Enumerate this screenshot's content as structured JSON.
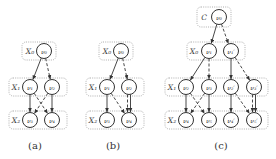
{
  "figure": {
    "panels": [
      {
        "id": "a",
        "caption": "(a)",
        "caption_pos": [
          35,
          145
        ],
        "groups": [
          {
            "label": "X0",
            "display": "X₀",
            "label_pos": [
              30,
              51
            ],
            "box": [
              22,
              42,
              34,
              18
            ]
          },
          {
            "label": "X1",
            "display": "X₁",
            "label_pos": [
              16,
              87
            ],
            "box": [
              9,
              78,
              58,
              18
            ]
          },
          {
            "label": "X2",
            "display": "X₂",
            "label_pos": [
              16,
              120
            ],
            "box": [
              9,
              111,
              58,
              18
            ]
          }
        ],
        "nodes": [
          {
            "id": "v0",
            "display": "ν₀",
            "pos": [
              44,
              51
            ]
          },
          {
            "id": "v1",
            "display": "ν₁",
            "pos": [
              30,
              87
            ]
          },
          {
            "id": "v2",
            "display": "ν₂",
            "pos": [
              52,
              87
            ]
          },
          {
            "id": "v3",
            "display": "ν₃",
            "pos": [
              30,
              120
            ]
          },
          {
            "id": "v4",
            "display": "ν₄",
            "pos": [
              52,
              120
            ]
          }
        ],
        "edges": [
          {
            "from": "v0",
            "to": "v1",
            "style": "solid"
          },
          {
            "from": "v0",
            "to": "v2",
            "style": "dashed"
          },
          {
            "from": "v1",
            "to": "v3",
            "style": "solid"
          },
          {
            "from": "v1",
            "to": "v4",
            "style": "dashed"
          },
          {
            "from": "v2",
            "to": "v3",
            "style": "dashed"
          },
          {
            "from": "v2",
            "to": "v4",
            "style": "solid"
          }
        ]
      },
      {
        "id": "b",
        "caption": "(b)",
        "caption_pos": [
          113,
          145
        ],
        "groups": [
          {
            "label": "X0",
            "display": "X₀",
            "label_pos": [
              107,
              51
            ],
            "box": [
              99,
              42,
              34,
              18
            ]
          },
          {
            "label": "X1",
            "display": "X₁",
            "label_pos": [
              93,
              87
            ],
            "box": [
              86,
              78,
              58,
              18
            ]
          },
          {
            "label": "X2",
            "display": "X₂",
            "label_pos": [
              93,
              120
            ],
            "box": [
              86,
              111,
              58,
              18
            ]
          }
        ],
        "nodes": [
          {
            "id": "v0",
            "display": "ν₀",
            "pos": [
              121,
              51
            ]
          },
          {
            "id": "v1",
            "display": "ν₁",
            "pos": [
              107,
              87
            ]
          },
          {
            "id": "v2",
            "display": "ν₂",
            "pos": [
              129,
              87
            ]
          },
          {
            "id": "v3",
            "display": "ν₃",
            "pos": [
              107,
              120
            ]
          },
          {
            "id": "v4",
            "display": "ν₄",
            "pos": [
              129,
              120
            ]
          }
        ],
        "edges": [
          {
            "from": "v0",
            "to": "v1",
            "style": "solid"
          },
          {
            "from": "v0",
            "to": "v2",
            "style": "dashed"
          },
          {
            "from": "v1",
            "to": "v3",
            "style": "solid"
          },
          {
            "from": "v1",
            "to": "v4",
            "style": "dashed"
          },
          {
            "from": "v2",
            "to": "v4",
            "style": "solid",
            "offset": -1.5
          },
          {
            "from": "v2",
            "to": "v4",
            "style": "dashed",
            "offset": 1.5
          }
        ]
      },
      {
        "id": "c",
        "caption": "(c)",
        "caption_pos": [
          221,
          145
        ],
        "groups": [
          {
            "label": "C",
            "display": "C",
            "label_pos": [
              204,
              17
            ],
            "box": [
              197,
              7,
              34,
              20
            ]
          },
          {
            "label": "X0",
            "display": "X₀",
            "label_pos": [
              194,
              51
            ],
            "box": [
              187,
              42,
              58,
              18
            ]
          },
          {
            "label": "X1",
            "display": "X₁",
            "label_pos": [
              172,
              87
            ],
            "box": [
              165,
              78,
              103,
              18
            ]
          },
          {
            "label": "X2",
            "display": "X₂",
            "label_pos": [
              172,
              120
            ],
            "box": [
              165,
              111,
              103,
              18
            ]
          }
        ],
        "nodes": [
          {
            "id": "v0",
            "display": "ν₀",
            "pos": [
              219,
              17
            ]
          },
          {
            "id": "v1",
            "display": "ν₁",
            "pos": [
              209,
              51
            ]
          },
          {
            "id": "v1p",
            "display": "ν₁′",
            "pos": [
              231,
              51
            ]
          },
          {
            "id": "v2",
            "display": "ν₂",
            "pos": [
              186,
              87
            ]
          },
          {
            "id": "v3",
            "display": "ν₃",
            "pos": [
              209,
              87
            ]
          },
          {
            "id": "v2p",
            "display": "ν₂′",
            "pos": [
              231,
              87
            ]
          },
          {
            "id": "v3p",
            "display": "ν₃′",
            "pos": [
              254,
              87
            ]
          },
          {
            "id": "v4",
            "display": "ν₄",
            "pos": [
              186,
              120
            ]
          },
          {
            "id": "v5",
            "display": "ν₅",
            "pos": [
              209,
              120
            ]
          },
          {
            "id": "v4p",
            "display": "ν₄′",
            "pos": [
              231,
              120
            ]
          },
          {
            "id": "v5p",
            "display": "ν₅′",
            "pos": [
              254,
              120
            ]
          }
        ],
        "edges": [
          {
            "from": "v0",
            "to": "v1",
            "style": "solid"
          },
          {
            "from": "v0",
            "to": "v1p",
            "style": "dashed"
          },
          {
            "from": "v1",
            "to": "v2",
            "style": "solid"
          },
          {
            "from": "v1",
            "to": "v3",
            "style": "dashed"
          },
          {
            "from": "v1p",
            "to": "v2p",
            "style": "solid"
          },
          {
            "from": "v1p",
            "to": "v3p",
            "style": "dashed"
          },
          {
            "from": "v2",
            "to": "v4",
            "style": "solid"
          },
          {
            "from": "v2",
            "to": "v5",
            "style": "dashed"
          },
          {
            "from": "v3",
            "to": "v4",
            "style": "dashed"
          },
          {
            "from": "v3",
            "to": "v5",
            "style": "solid"
          },
          {
            "from": "v2p",
            "to": "v4p",
            "style": "solid"
          },
          {
            "from": "v2p",
            "to": "v5p",
            "style": "dashed"
          },
          {
            "from": "v3p",
            "to": "v5p",
            "style": "solid",
            "offset": -1.5
          },
          {
            "from": "v3p",
            "to": "v5p",
            "style": "dashed",
            "offset": 1.5
          }
        ]
      }
    ],
    "node_radius": 7.5
  }
}
